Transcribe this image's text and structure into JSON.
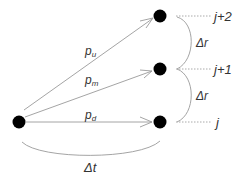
{
  "diagram": {
    "type": "trinomial-tree-step",
    "colors": {
      "node": "#000000",
      "edge": "#999999",
      "dotted": "#aaaaaa",
      "text": "#333333"
    },
    "nodes": [
      {
        "id": "origin",
        "x": 19,
        "y": 122
      },
      {
        "id": "up",
        "x": 160,
        "y": 16
      },
      {
        "id": "mid",
        "x": 160,
        "y": 69
      },
      {
        "id": "down",
        "x": 160,
        "y": 122
      }
    ],
    "edges": [
      {
        "from": "origin",
        "to": "up",
        "label": "p",
        "sub": "u"
      },
      {
        "from": "origin",
        "to": "mid",
        "label": "p",
        "sub": "m"
      },
      {
        "from": "origin",
        "to": "down",
        "label": "p",
        "sub": "d"
      }
    ],
    "levels": [
      {
        "label": "j+2"
      },
      {
        "label": "j+1"
      },
      {
        "label": "j"
      }
    ],
    "spacing": [
      {
        "label": "Δr"
      },
      {
        "label": "Δr"
      }
    ],
    "time_step": {
      "label": "Δt"
    }
  }
}
